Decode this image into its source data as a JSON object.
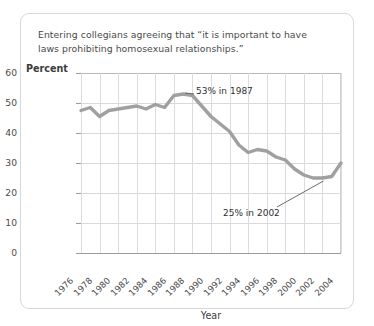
{
  "chart_data": {
    "type": "line",
    "title": "Entering collegians agreeing that “it is important to have laws prohibiting homosexual relationships.”",
    "xlabel": "Year",
    "ylabel": "Percent",
    "ylim": [
      0,
      60
    ],
    "xlim": [
      1976,
      2004
    ],
    "grid": true,
    "legend": "none",
    "line_color": "#a0a0a0",
    "x": [
      1976,
      1977,
      1978,
      1979,
      1980,
      1981,
      1982,
      1983,
      1984,
      1985,
      1986,
      1987,
      1988,
      1989,
      1990,
      1991,
      1992,
      1993,
      1994,
      1995,
      1996,
      1997,
      1998,
      1999,
      2000,
      2001,
      2002,
      2003,
      2004
    ],
    "values": [
      47.5,
      48.5,
      45.5,
      47.5,
      48.0,
      48.5,
      49.0,
      48.0,
      49.5,
      48.5,
      52.5,
      53.0,
      52.5,
      49.0,
      45.5,
      43.0,
      40.5,
      36.0,
      33.5,
      34.5,
      34.0,
      32.0,
      31.0,
      28.0,
      26.0,
      25.0,
      25.0,
      25.5,
      30.0
    ],
    "ytick_values": [
      0,
      10,
      20,
      30,
      40,
      50,
      60
    ],
    "xtick_values": [
      1976,
      1978,
      1980,
      1982,
      1984,
      1986,
      1988,
      1990,
      1992,
      1994,
      1996,
      1998,
      2000,
      2002,
      2004
    ],
    "ytick_labels": [
      "0",
      "10",
      "20",
      "30",
      "40",
      "50",
      "60"
    ],
    "xtick_labels": [
      "1976",
      "1978",
      "1980",
      "1982",
      "1984",
      "1986",
      "1988",
      "1990",
      "1992",
      "1994",
      "1996",
      "1998",
      "2000",
      "2002",
      "2004"
    ],
    "annotations": [
      {
        "text": "53% in 1987",
        "point_x": 1987,
        "point_y": 53
      },
      {
        "text": "25% in 2002",
        "point_x": 2002,
        "point_y": 25
      }
    ]
  },
  "figure": {
    "title": "Entering collegians agreeing that “it is important to have laws prohibiting homosexual relationships.”",
    "y_axis_label": "Percent",
    "x_axis_title": "Year",
    "annotation_peak": "53% in 1987",
    "annotation_low": "25% in 2002"
  }
}
